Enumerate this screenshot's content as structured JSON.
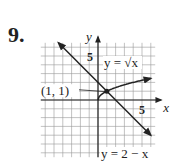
{
  "problem_number": "9.",
  "chart_data": {
    "type": "line",
    "title": "",
    "xlabel": "x",
    "ylabel": "y",
    "xlim": [
      -6.5,
      6.5
    ],
    "ylim": [
      -6.5,
      6.5
    ],
    "grid": true,
    "ticks_labeled": {
      "x": [
        5
      ],
      "y": [
        5
      ]
    },
    "series": [
      {
        "name": "y = √x",
        "expression": "sqrt(x)",
        "domain": [
          0,
          6
        ],
        "arrow_end": true,
        "points": [
          [
            0,
            0
          ],
          [
            0.25,
            0.5
          ],
          [
            1,
            1
          ],
          [
            2,
            1.41
          ],
          [
            4,
            2
          ],
          [
            6,
            2.45
          ]
        ]
      },
      {
        "name": "y = 2 − x",
        "expression": "2 - x",
        "domain": [
          -4.5,
          6
        ],
        "arrow_both": true,
        "points": [
          [
            -4.5,
            6.5
          ],
          [
            6,
            -4
          ]
        ]
      }
    ],
    "annotations": [
      {
        "text": "(1, 1)",
        "point": [
          1,
          1
        ],
        "type": "intersection"
      }
    ],
    "labels": {
      "x_tick_5": "5",
      "y_tick_5": "5",
      "sqrt_label": "y = √x",
      "line_label": "y = 2 − x",
      "intersection_label": "(1, 1)"
    }
  }
}
